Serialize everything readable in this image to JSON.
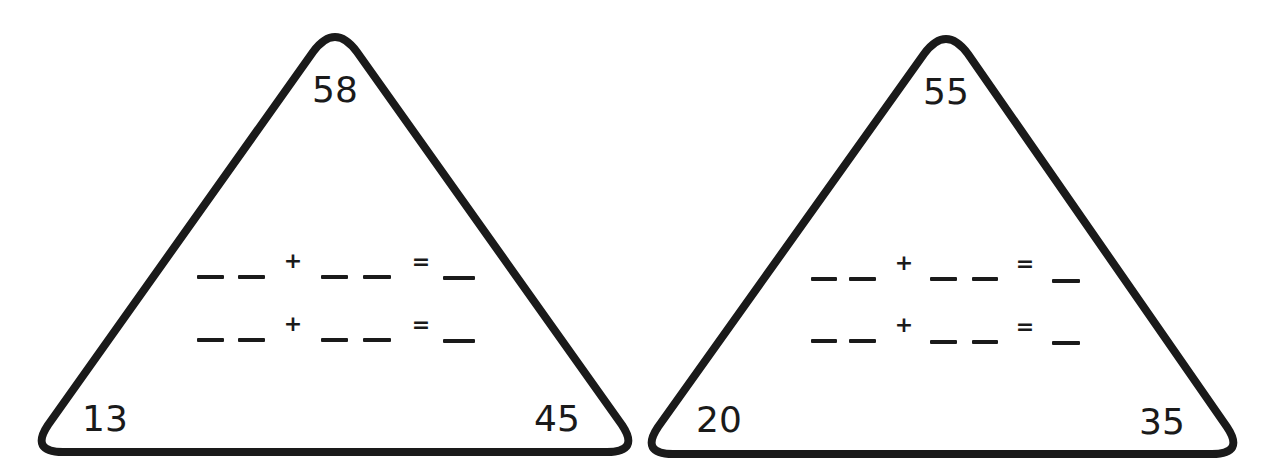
{
  "worksheet": {
    "triangles": [
      {
        "top": "58",
        "bottom_left": "13",
        "bottom_right": "45",
        "equations": [
          {
            "plus": "+",
            "equals": "="
          },
          {
            "plus": "+",
            "equals": "="
          }
        ]
      },
      {
        "top": "55",
        "bottom_left": "20",
        "bottom_right": "35",
        "equations": [
          {
            "plus": "+",
            "equals": "="
          },
          {
            "plus": "+",
            "equals": "="
          }
        ]
      }
    ]
  },
  "colors": {
    "stroke": "#1a1a1a",
    "background": "#ffffff"
  }
}
